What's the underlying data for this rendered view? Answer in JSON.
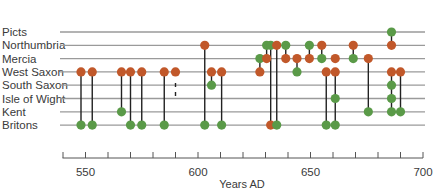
{
  "chart_data": {
    "type": "scatter",
    "title": "",
    "xlabel": "Years AD",
    "ylabel": "",
    "xlim": [
      540,
      700
    ],
    "x_ticks_major": [
      550,
      600,
      650,
      700
    ],
    "x_tick_interval": 10,
    "categories": [
      "Picts",
      "Northumbria",
      "Mercia",
      "West Saxon",
      "South Saxon",
      "Isle of Wight",
      "Kent",
      "Britons"
    ],
    "legend": [
      {
        "name": "Victor / attacker",
        "color": "#c1582a"
      },
      {
        "name": "Defeated / opponent",
        "color": "#5a9a48"
      }
    ],
    "grid": false,
    "events": [
      {
        "year": 548,
        "points": [
          {
            "row": "West Saxon",
            "color": "orange"
          },
          {
            "row": "Britons",
            "color": "green"
          }
        ]
      },
      {
        "year": 553,
        "points": [
          {
            "row": "West Saxon",
            "color": "orange"
          },
          {
            "row": "Britons",
            "color": "green"
          }
        ]
      },
      {
        "year": 566,
        "points": [
          {
            "row": "West Saxon",
            "color": "orange"
          },
          {
            "row": "Kent",
            "color": "green"
          }
        ]
      },
      {
        "year": 570,
        "points": [
          {
            "row": "West Saxon",
            "color": "orange"
          },
          {
            "row": "Britons",
            "color": "green"
          }
        ]
      },
      {
        "year": 575,
        "points": [
          {
            "row": "West Saxon",
            "color": "orange"
          },
          {
            "row": "Britons",
            "color": "green"
          }
        ]
      },
      {
        "year": 585,
        "points": [
          {
            "row": "West Saxon",
            "color": "orange"
          },
          {
            "row": "Britons",
            "color": "green"
          }
        ]
      },
      {
        "year": 590,
        "points": [
          {
            "row": "West Saxon",
            "color": "orange"
          }
        ],
        "dashed_to": "Isle of Wight"
      },
      {
        "year": 603,
        "points": [
          {
            "row": "Northumbria",
            "color": "orange"
          },
          {
            "row": "Britons",
            "color": "green"
          }
        ]
      },
      {
        "year": 606,
        "points": [
          {
            "row": "West Saxon",
            "color": "orange"
          },
          {
            "row": "South Saxon",
            "color": "green"
          }
        ]
      },
      {
        "year": 610.5,
        "points": [
          {
            "row": "West Saxon",
            "color": "orange"
          },
          {
            "row": "Britons",
            "color": "green"
          }
        ]
      },
      {
        "year": 627.5,
        "points": [
          {
            "row": "Mercia",
            "color": "green"
          },
          {
            "row": "West Saxon",
            "color": "orange"
          }
        ]
      },
      {
        "year": 630.5,
        "points": [
          {
            "row": "Northumbria",
            "color": "green"
          },
          {
            "row": "Mercia",
            "color": "orange"
          }
        ]
      },
      {
        "year": 632.3,
        "points": [
          {
            "row": "Northumbria",
            "color": "green"
          },
          {
            "row": "Britons",
            "color": "orange"
          }
        ]
      },
      {
        "year": 635,
        "points": [
          {
            "row": "Northumbria",
            "color": "orange"
          },
          {
            "row": "Britons",
            "color": "green"
          }
        ]
      },
      {
        "year": 639,
        "points": [
          {
            "row": "Northumbria",
            "color": "green"
          },
          {
            "row": "Mercia",
            "color": "orange"
          }
        ]
      },
      {
        "year": 644,
        "points": [
          {
            "row": "Mercia",
            "color": "orange"
          },
          {
            "row": "West Saxon",
            "color": "green"
          }
        ]
      },
      {
        "year": 649.5,
        "points": [
          {
            "row": "Northumbria",
            "color": "green"
          },
          {
            "row": "Mercia",
            "color": "orange"
          }
        ]
      },
      {
        "year": 655,
        "points": [
          {
            "row": "Northumbria",
            "color": "orange"
          },
          {
            "row": "Mercia",
            "color": "green"
          }
        ]
      },
      {
        "year": 657,
        "points": [
          {
            "row": "West Saxon",
            "color": "orange"
          },
          {
            "row": "Britons",
            "color": "green"
          }
        ]
      },
      {
        "year": 661,
        "points": [
          {
            "row": "Mercia",
            "color": "orange"
          }
        ]
      },
      {
        "year": 661,
        "points": [
          {
            "row": "West Saxon",
            "color": "orange"
          },
          {
            "row": "Isle of Wight",
            "color": "green"
          },
          {
            "row": "Britons",
            "color": "green"
          }
        ]
      },
      {
        "year": 669,
        "points": [
          {
            "row": "Northumbria",
            "color": "orange"
          },
          {
            "row": "Mercia",
            "color": "green"
          }
        ]
      },
      {
        "year": 675.7,
        "points": [
          {
            "row": "Mercia",
            "color": "orange"
          },
          {
            "row": "Kent",
            "color": "green"
          }
        ]
      },
      {
        "year": 686,
        "points": [
          {
            "row": "Picts",
            "color": "green"
          },
          {
            "row": "Northumbria",
            "color": "orange"
          }
        ]
      },
      {
        "year": 686,
        "points": [
          {
            "row": "West Saxon",
            "color": "orange"
          },
          {
            "row": "South Saxon",
            "color": "green"
          },
          {
            "row": "Isle of Wight",
            "color": "green"
          },
          {
            "row": "Kent",
            "color": "green"
          }
        ]
      },
      {
        "year": 690,
        "points": [
          {
            "row": "West Saxon",
            "color": "orange"
          },
          {
            "row": "Kent",
            "color": "green"
          }
        ]
      }
    ]
  },
  "colors": {
    "orange": "#c1582a",
    "green": "#5a9a48",
    "row_line": "#9a9a9a",
    "connector": "#222222",
    "axis": "#555555",
    "text": "#3a3a3a"
  },
  "labels": {
    "rows": [
      "Picts",
      "Northumbria",
      "Mercia",
      "West Saxon",
      "South Saxon",
      "Isle of Wight",
      "Kent",
      "Britons"
    ],
    "ticks": [
      "550",
      "600",
      "650",
      "700"
    ],
    "axis_title": "Years AD"
  }
}
